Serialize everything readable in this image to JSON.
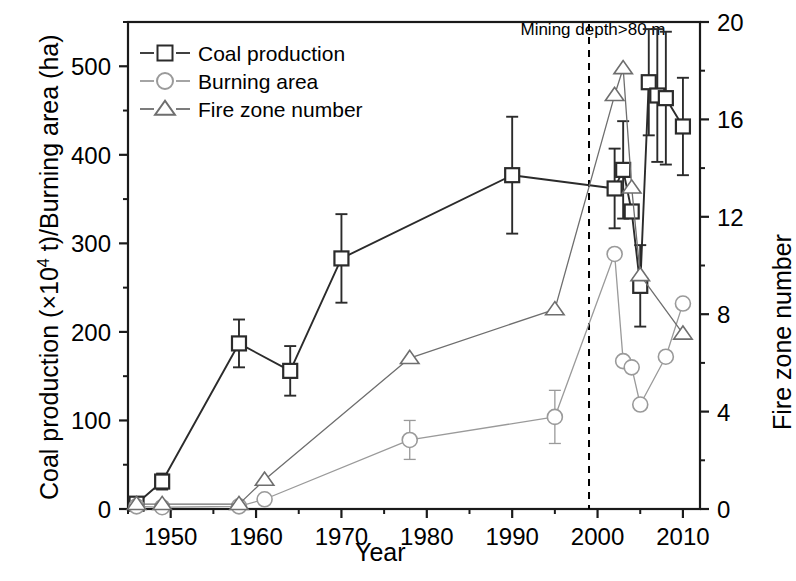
{
  "chart_data": {
    "type": "line",
    "title": "",
    "xlabel": "Year",
    "ylabel_left": "Coal production (×10⁴ t)/Burning area (ha)",
    "ylabel_right": "Fire zone number",
    "xlim": [
      1945,
      2012
    ],
    "ylim_left": [
      0,
      550
    ],
    "ylim_right": [
      0,
      20
    ],
    "xticks": [
      1950,
      1960,
      1970,
      1980,
      1990,
      2000,
      2010
    ],
    "xticklabels": [
      "1950",
      "1960",
      "1970",
      "1980",
      "1990",
      "2000",
      "2010"
    ],
    "xminorticks": [
      1945,
      1955,
      1965,
      1975,
      1985,
      1995,
      2005
    ],
    "yticks_left": [
      0,
      100,
      200,
      300,
      400,
      500
    ],
    "yticklabels_left": [
      "0",
      "100",
      "200",
      "300",
      "400",
      "500"
    ],
    "yminorticks_left": [
      50,
      150,
      250,
      350,
      450,
      550
    ],
    "yticks_right": [
      0,
      4,
      8,
      12,
      16,
      20
    ],
    "yticklabels_right": [
      "0",
      "4",
      "8",
      "12",
      "16",
      "20"
    ],
    "yminorticks_right": [
      2,
      6,
      10,
      14,
      18
    ],
    "grid": false,
    "legend_position": "upper-left",
    "annotations": [
      {
        "text": "Mining depth>80 m",
        "x": 1999,
        "y": 540,
        "type": "vline-label"
      }
    ],
    "reference_lines": [
      {
        "orientation": "vertical",
        "x": 1999,
        "style": "dashed",
        "color": "#000000"
      }
    ],
    "series": [
      {
        "name": "Coal production",
        "marker": "square",
        "axis": "left",
        "color": "#2b2b2b",
        "unit": "×10⁴ t",
        "points": [
          {
            "x": 1946,
            "y": 6,
            "err": 4
          },
          {
            "x": 1949,
            "y": 31,
            "err": 9
          },
          {
            "x": 1958,
            "y": 187,
            "err": 27
          },
          {
            "x": 1964,
            "y": 156,
            "err": 28
          },
          {
            "x": 1970,
            "y": 283,
            "err": 50
          },
          {
            "x": 1990,
            "y": 377,
            "err": 66
          },
          {
            "x": 2002,
            "y": 362,
            "err": 45
          },
          {
            "x": 2003,
            "y": 383,
            "err": 55
          },
          {
            "x": 2004,
            "y": 336,
            "err": 0
          },
          {
            "x": 2005,
            "y": 252,
            "err": 46
          },
          {
            "x": 2006,
            "y": 482,
            "err": 60
          },
          {
            "x": 2007,
            "y": 467,
            "err": 75
          },
          {
            "x": 2008,
            "y": 464,
            "err": 75
          },
          {
            "x": 2010,
            "y": 432,
            "err": 55
          }
        ]
      },
      {
        "name": "Burning area",
        "marker": "circle",
        "axis": "left",
        "color": "#9a9a9a",
        "unit": "ha",
        "points": [
          {
            "x": 1946,
            "y": 3,
            "err": 0
          },
          {
            "x": 1949,
            "y": 2,
            "err": 0
          },
          {
            "x": 1958,
            "y": 3,
            "err": 0
          },
          {
            "x": 1961,
            "y": 11,
            "err": 0
          },
          {
            "x": 1978,
            "y": 78,
            "err": 22
          },
          {
            "x": 1995,
            "y": 104,
            "err": 30
          },
          {
            "x": 2002,
            "y": 288,
            "err": 0
          },
          {
            "x": 2003,
            "y": 167,
            "err": 0
          },
          {
            "x": 2004,
            "y": 160,
            "err": 0
          },
          {
            "x": 2005,
            "y": 118,
            "err": 0
          },
          {
            "x": 2008,
            "y": 172,
            "err": 0
          },
          {
            "x": 2010,
            "y": 232,
            "err": 0
          }
        ]
      },
      {
        "name": "Fire zone number",
        "marker": "triangle",
        "axis": "right",
        "color": "#6e6e6e",
        "unit": "count",
        "points": [
          {
            "x": 1946,
            "y": 0.2,
            "err": 0
          },
          {
            "x": 1949,
            "y": 0.2,
            "err": 0
          },
          {
            "x": 1958,
            "y": 0.2,
            "err": 0
          },
          {
            "x": 1961,
            "y": 1.2,
            "err": 0
          },
          {
            "x": 1978,
            "y": 6.2,
            "err": 0
          },
          {
            "x": 1995,
            "y": 8.2,
            "err": 0
          },
          {
            "x": 2002,
            "y": 17.0,
            "err": 0
          },
          {
            "x": 2003,
            "y": 18.1,
            "err": 0
          },
          {
            "x": 2004,
            "y": 13.2,
            "err": 0
          },
          {
            "x": 2005,
            "y": 9.6,
            "err": 0
          },
          {
            "x": 2010,
            "y": 7.2,
            "err": 0
          }
        ]
      }
    ]
  },
  "legend": {
    "items": [
      {
        "label": "Coal production",
        "marker": "square",
        "color": "#2b2b2b"
      },
      {
        "label": "Burning area",
        "marker": "circle",
        "color": "#9a9a9a"
      },
      {
        "label": "Fire zone number",
        "marker": "triangle",
        "color": "#6e6e6e"
      }
    ]
  },
  "axes": {
    "x_title": "Year",
    "y_left_title_pre": "Coal production (×10",
    "y_left_title_sup": "4",
    "y_left_title_post": " t)/Burning area (ha)",
    "y_right_title": "Fire zone number"
  },
  "annotation": {
    "mining_depth": "Mining depth>80 m"
  }
}
